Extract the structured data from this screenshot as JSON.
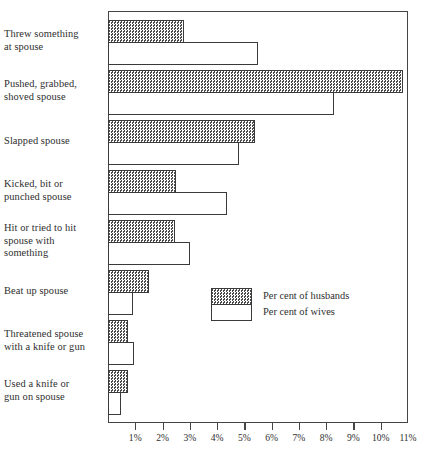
{
  "chart_data": {
    "type": "bar",
    "orientation": "horizontal",
    "title": "",
    "xlabel": "",
    "ylabel": "",
    "grid": false,
    "legend_position": "inside-center-right",
    "xlim": [
      0,
      11
    ],
    "xtick_labels": [
      "1%",
      "2%",
      "3%",
      "4%",
      "5%",
      "6%",
      "7%",
      "8%",
      "9%",
      "10%",
      "11%"
    ],
    "xtick_values": [
      1,
      2,
      3,
      4,
      5,
      6,
      7,
      8,
      9,
      10,
      11
    ],
    "categories": [
      "Threw something at spouse",
      "Pushed, grabbed, shoved spouse",
      "Slapped spouse",
      "Kicked, bit or punched spouse",
      "Hit or tried to hit spouse with something",
      "Beat up spouse",
      "Threatened spouse with a knife or gun",
      "Used a knife or gun on spouse"
    ],
    "category_lines": [
      [
        "Threw something",
        "at spouse"
      ],
      [
        "Pushed, grabbed,",
        "shoved spouse"
      ],
      [
        "Slapped spouse"
      ],
      [
        "Kicked, bit or",
        "punched spouse"
      ],
      [
        "Hit or tried to hit",
        "spouse with",
        "something"
      ],
      [
        "Beat up spouse"
      ],
      [
        "Threatened spouse",
        "with a knife or gun"
      ],
      [
        "Used a knife or",
        "gun on spouse"
      ]
    ],
    "series": [
      {
        "name": "Per cent of husbands",
        "fill": "hatched-gray",
        "values": [
          2.8,
          10.8,
          5.4,
          2.5,
          2.45,
          1.5,
          0.73,
          0.73
        ]
      },
      {
        "name": "Per cent of wives",
        "fill": "white",
        "values": [
          5.5,
          8.3,
          4.8,
          4.35,
          3.0,
          0.9,
          0.95,
          0.48
        ]
      }
    ]
  },
  "legend": {
    "husbands_label": "Per cent of husbands",
    "wives_label": "Per cent of wives"
  },
  "colors": {
    "axis": "#454545",
    "bar_outline": "#3a3a3a",
    "husbands_fill": "#8c8c8c",
    "wives_fill": "#ffffff",
    "text": "#2e2e2e"
  }
}
